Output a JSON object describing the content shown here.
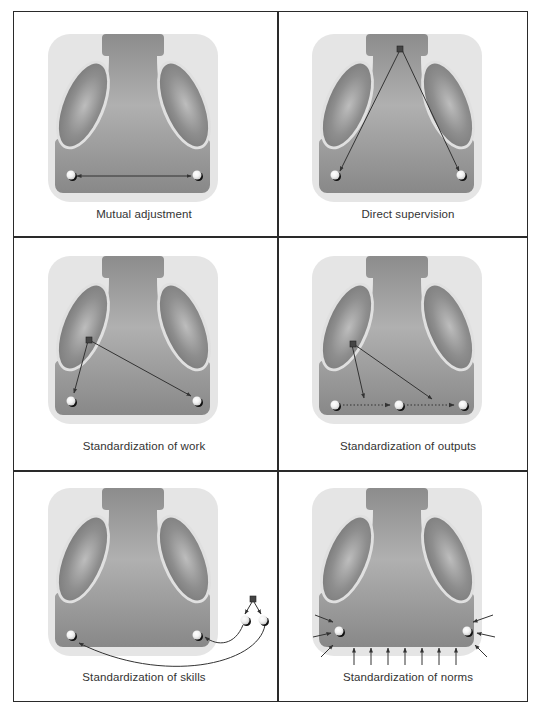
{
  "figure": {
    "colors": {
      "frame": "#2a2a2a",
      "background_square": "#e4e4e4",
      "shape_body": "#8a8a8a",
      "shape_light": "#b4b4b4",
      "node": "#ffffff",
      "arrow": "#333333",
      "label": "#333333"
    },
    "panels": [
      {
        "id": "mutual-adjustment",
        "label": "Mutual adjustment",
        "connection": "double-headed arrow between two operators"
      },
      {
        "id": "direct-supervision",
        "label": "Direct supervision",
        "connection": "arrows from top manager node to both operators"
      },
      {
        "id": "standardization-of-work",
        "label": "Standardization of work",
        "connection": "arrows from technostructure node to both operators"
      },
      {
        "id": "standardization-of-outputs",
        "label": "Standardization of outputs",
        "connection": "arrows from technostructure to dotted output flow between three operators"
      },
      {
        "id": "standardization-of-skills",
        "label": "Standardization of skills",
        "connection": "external square node trains two operators outside, curved arrows to both inside operators"
      },
      {
        "id": "standardization-of-norms",
        "label": "Standardization of norms",
        "connection": "many small arrows pressing in on the operating base from outside"
      }
    ]
  }
}
